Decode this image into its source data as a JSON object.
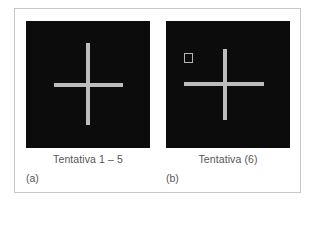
{
  "figure": {
    "panels": [
      {
        "id": "a",
        "label": "(a)",
        "caption": "Tentativa 1 – 5",
        "background": "#0c0c0c",
        "cross_color": "#bdbdbd",
        "has_target_square": false
      },
      {
        "id": "b",
        "label": "(b)",
        "caption": "Tentativa (6)",
        "background": "#0c0c0c",
        "cross_color": "#bdbdbd",
        "has_target_square": true
      }
    ]
  }
}
